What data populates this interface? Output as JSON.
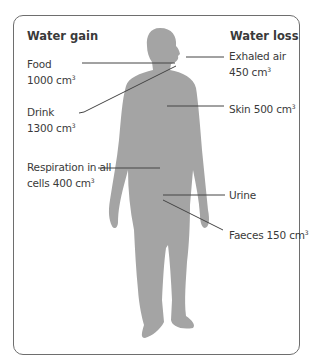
{
  "diagram": {
    "headers": {
      "gain": "Water gain",
      "loss": "Water loss"
    },
    "gain_labels": [
      {
        "line1": "Food",
        "line2": "1000 cm",
        "sup": "3"
      },
      {
        "line1": "Drink",
        "line2": "1300 cm",
        "sup": "3"
      },
      {
        "line1": "Respiration in all",
        "line2": "cells 400 cm",
        "sup": "3"
      }
    ],
    "loss_labels": [
      {
        "line1": "Exhaled air",
        "line2": "450 cm",
        "sup": "3"
      },
      {
        "line1": "Skin 500 cm",
        "sup": "3"
      },
      {
        "line1": "Urine"
      },
      {
        "line1": "Faeces 150 cm",
        "sup": "3"
      }
    ],
    "colors": {
      "body": "#a4a4a4",
      "line": "#444444",
      "border": "#6e6e6e",
      "text": "#3a3a3a"
    }
  }
}
